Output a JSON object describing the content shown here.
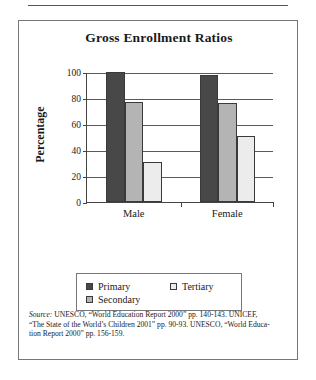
{
  "figure": {
    "title": "Gross Enrollment Ratios"
  },
  "chart_data": {
    "type": "bar",
    "title": "Gross Enrollment Ratios",
    "xlabel": "",
    "ylabel": "Percentage",
    "ylim": [
      0,
      100
    ],
    "yticks": [
      0,
      20,
      40,
      60,
      80,
      100
    ],
    "ytick_labels": [
      "0",
      "20",
      "40",
      "60",
      "80",
      "100"
    ],
    "grid": true,
    "legend_position": "below-plot",
    "categories": [
      "Male",
      "Female"
    ],
    "series": [
      {
        "name": "Primary",
        "values": [
          100,
          98
        ],
        "color": "#484848"
      },
      {
        "name": "Secondary",
        "values": [
          77,
          76
        ],
        "color": "#b4b4b4"
      },
      {
        "name": "Tertiary",
        "values": [
          31,
          51
        ],
        "color": "#ececec"
      }
    ]
  },
  "legend": {
    "entries": [
      {
        "label": "Primary"
      },
      {
        "label": "Tertiary"
      },
      {
        "label": "Secondary"
      }
    ]
  },
  "source": {
    "prefix": "Source:",
    "line1": " UNESCO, “World Education Report 2000” pp. 140-143. UNICEF,",
    "line2": "“The State of the World’s Children 2001” pp. 90-93. UNESCO, “World Educa-",
    "line3": "tion Report 2000” pp. 156-159."
  }
}
